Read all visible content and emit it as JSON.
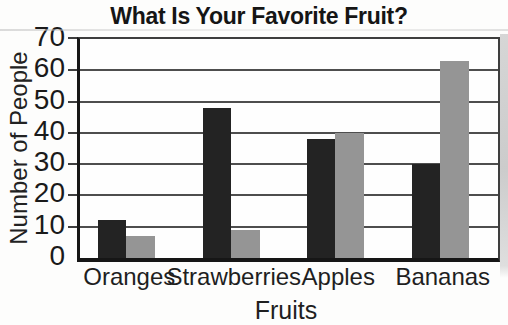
{
  "chart_data": {
    "type": "bar",
    "title": "What Is Your Favorite Fruit?",
    "xlabel": "Fruits",
    "ylabel": "Number of People",
    "categories": [
      "Oranges",
      "Strawberries",
      "Apples",
      "Bananas"
    ],
    "series": [
      {
        "name": "black-bars",
        "color": "#232323",
        "values": [
          12,
          48,
          38,
          30
        ]
      },
      {
        "name": "gray-bars",
        "color": "#959595",
        "values": [
          7,
          9,
          40,
          63
        ]
      }
    ],
    "ylim": [
      0,
      70
    ],
    "yticks": [
      0,
      10,
      20,
      30,
      40,
      50,
      60,
      70
    ],
    "grid": true,
    "legend_position": "none",
    "colors": {
      "axis": "#161616",
      "gridline": "#4e4e4e",
      "text": "#1b1b1b",
      "background": "#fdfdfc"
    }
  }
}
